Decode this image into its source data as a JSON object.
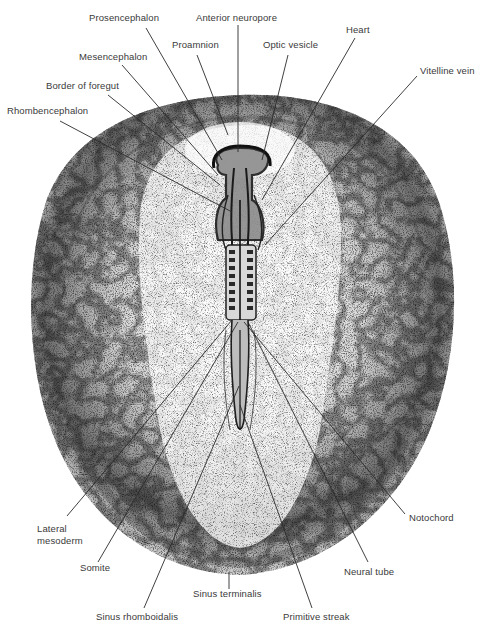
{
  "figure": {
    "colors": {
      "ink": "#2a2a2a",
      "label_text": "#3a3a3a",
      "stipple_dark": "#4a4a4a",
      "stipple_mid": "#9a9a9a",
      "background": "#ffffff"
    },
    "labels": [
      {
        "id": "prosencephalon",
        "text": "Prosencephalon",
        "x": 89,
        "y": 21,
        "anchor": "start",
        "line": [
          146,
          28,
          222,
          160
        ]
      },
      {
        "id": "anterior-neuropore",
        "text": "Anterior neuropore",
        "x": 196,
        "y": 21,
        "anchor": "start",
        "line": [
          238,
          25,
          238,
          152
        ]
      },
      {
        "id": "proamnion",
        "text": "Proamnion",
        "x": 172,
        "y": 48,
        "anchor": "start",
        "line": [
          197,
          55,
          228,
          135
        ]
      },
      {
        "id": "optic-vesicle",
        "text": "Optic vesicle",
        "x": 263,
        "y": 48,
        "anchor": "start",
        "line": [
          288,
          55,
          262,
          160
        ]
      },
      {
        "id": "heart",
        "text": "Heart",
        "x": 346,
        "y": 33,
        "anchor": "start",
        "line": [
          355,
          38,
          262,
          200
        ]
      },
      {
        "id": "mesencephalon",
        "text": "Mesencephalon",
        "x": 79,
        "y": 60,
        "anchor": "start",
        "line": [
          122,
          65,
          218,
          175
        ]
      },
      {
        "id": "vitelline-vein",
        "text": "Vitelline vein",
        "x": 420,
        "y": 74,
        "anchor": "start",
        "line": [
          417,
          76,
          265,
          245
        ]
      },
      {
        "id": "border-of-foregut",
        "text": "Border of foregut",
        "x": 46,
        "y": 89,
        "anchor": "start",
        "line": [
          108,
          95,
          220,
          185
        ]
      },
      {
        "id": "rhombencephalon",
        "text": "Rhombencephalon",
        "x": 7,
        "y": 114,
        "anchor": "start",
        "line": [
          60,
          121,
          232,
          212
        ]
      },
      {
        "id": "notochord",
        "text": "Notochord",
        "x": 409,
        "y": 521,
        "anchor": "start",
        "line": [
          405,
          514,
          244,
          322
        ]
      },
      {
        "id": "lateral-mesoderm",
        "text": "Lateral",
        "text2": "mesoderm",
        "x": 37,
        "y": 532,
        "anchor": "start",
        "line": [
          67,
          516,
          232,
          320
        ]
      },
      {
        "id": "somite",
        "text": "Somite",
        "x": 80,
        "y": 571,
        "anchor": "start",
        "line": [
          98,
          562,
          238,
          322
        ]
      },
      {
        "id": "neural-tube",
        "text": "Neural tube",
        "x": 344,
        "y": 575,
        "anchor": "start",
        "line": [
          368,
          562,
          248,
          322
        ]
      },
      {
        "id": "sinus-terminalis",
        "text": "Sinus terminalis",
        "x": 193,
        "y": 597,
        "anchor": "start",
        "line": [
          229,
          589,
          229,
          572
        ]
      },
      {
        "id": "sinus-rhomboidalis",
        "text": "Sinus rhomboidalis",
        "x": 96,
        "y": 620,
        "anchor": "start",
        "line": [
          144,
          608,
          239,
          386
        ]
      },
      {
        "id": "primitive-streak",
        "text": "Primitive streak",
        "x": 283,
        "y": 620,
        "anchor": "start",
        "line": [
          312,
          608,
          240,
          405
        ]
      }
    ]
  }
}
